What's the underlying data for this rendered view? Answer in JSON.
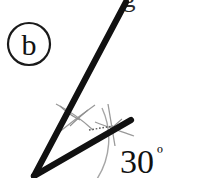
{
  "figure": {
    "kind": "geometry-angle-construction",
    "background_color": "#ffffff",
    "ink_color": "#111111",
    "construction_color": "#9a9a9a",
    "part_label": "b",
    "angle_label": "30",
    "degree_symbol": "º",
    "angle_label_full": "30º",
    "cut_off_top_text": "g",
    "vertex": {
      "x": 34,
      "y": 176
    },
    "rays": [
      {
        "name": "upper-ray",
        "from_x": 34,
        "from_y": 176,
        "to_x": 126,
        "to_y": 2,
        "approx_degrees_from_horizontal": 62,
        "stroke_width": 6
      },
      {
        "name": "lower-ray",
        "from_x": 34,
        "from_y": 176,
        "to_x": 131,
        "to_y": 120,
        "approx_degrees_from_horizontal": 30,
        "stroke_width": 6
      }
    ],
    "angle_arc": {
      "name": "angle-sweep-arc",
      "center_x": 34,
      "center_y": 176,
      "radius": 74,
      "stroke_width": 1.4
    },
    "construction_arcs": [
      {
        "name": "arc-mark-upper-ray",
        "center_x": 75,
        "center_y": 118
      },
      {
        "name": "arc-mark-lower-ray",
        "center_x": 113,
        "center_y": 131
      }
    ],
    "dotted_segment": {
      "name": "dotted-guide",
      "from_x": 89,
      "from_y": 130,
      "to_x": 113,
      "to_y": 126
    },
    "part_label_circle": {
      "center_x": 29,
      "center_y": 44,
      "radius": 21,
      "stroke_width": 2.2
    }
  }
}
